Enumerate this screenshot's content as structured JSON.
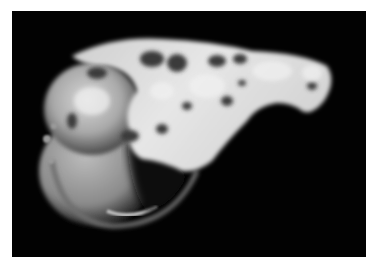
{
  "image": {
    "subject": "gross specimen photograph",
    "background_color": "#020202",
    "border_color": "#ffffff",
    "tone": "grayscale"
  }
}
